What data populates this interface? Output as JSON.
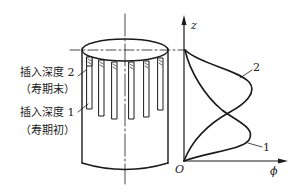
{
  "diagram": {
    "type": "schematic",
    "colors": {
      "line": "#1a1a1a",
      "background": "#ffffff"
    },
    "left_labels": [
      {
        "id": "depth2",
        "text": "插入深度 2",
        "sub": "（寿期末）"
      },
      {
        "id": "depth1",
        "text": "插入深度 1",
        "sub": "（寿期初）"
      }
    ],
    "graph": {
      "y_axis_label": "z",
      "x_axis_label": "ϕ",
      "origin_label": "O",
      "curves": [
        {
          "id": "1",
          "label": "1",
          "peak_position": "lower"
        },
        {
          "id": "2",
          "label": "2",
          "peak_position": "upper"
        }
      ]
    }
  }
}
